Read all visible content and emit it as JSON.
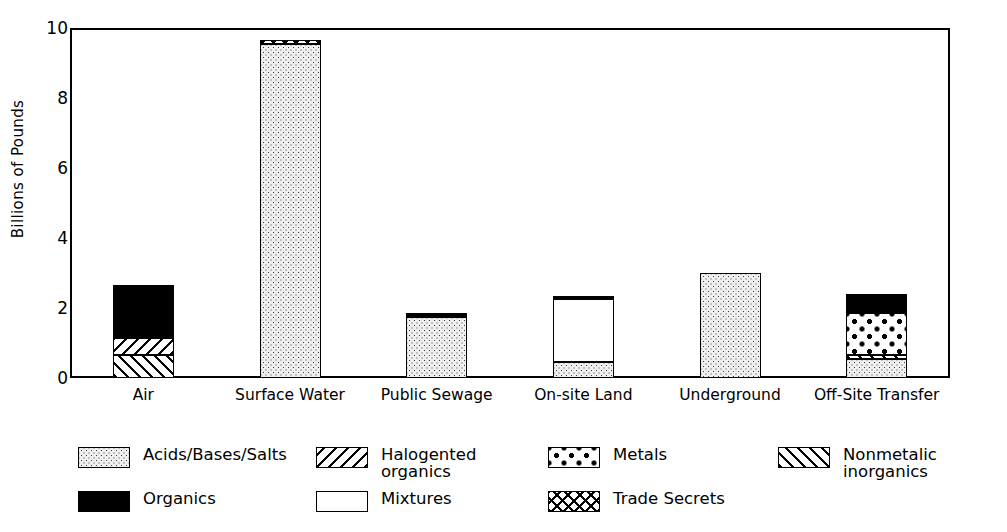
{
  "chart_data": {
    "type": "bar",
    "title": "",
    "xlabel": "",
    "ylabel": "Billions of Pounds",
    "ylim": [
      0,
      10
    ],
    "yticks": [
      0,
      2,
      4,
      6,
      8,
      10
    ],
    "grid": false,
    "stacked": true,
    "legend_position": "bottom",
    "categories": [
      "Air",
      "Surface Water",
      "Public Sewage",
      "On-site Land",
      "Underground",
      "Off-Site Transfer"
    ],
    "series": [
      {
        "name": "Acids/Bases/Salts",
        "key": "acids",
        "pattern": "fine-dots",
        "values": [
          0,
          9.55,
          1.75,
          0.47,
          3.0,
          0.55
        ]
      },
      {
        "name": "Organics",
        "key": "organics",
        "pattern": "solid-black",
        "values": [
          1.5,
          0,
          0.1,
          0.1,
          0,
          0.55
        ]
      },
      {
        "name": "Halogented organics",
        "key": "halo",
        "pattern": "backslash-hatch",
        "values": [
          0.5,
          0,
          0,
          0,
          0,
          0
        ]
      },
      {
        "name": "Mixtures",
        "key": "mixtures",
        "pattern": "white",
        "values": [
          0,
          0,
          0,
          1.78,
          0,
          0
        ]
      },
      {
        "name": "Metals",
        "key": "metals",
        "pattern": "coarse-dots",
        "values": [
          0,
          0,
          0,
          0,
          0,
          1.2
        ]
      },
      {
        "name": "Trade Secrets",
        "key": "trade",
        "pattern": "cross-hatch",
        "values": [
          0,
          0.1,
          0,
          0,
          0,
          0
        ]
      },
      {
        "name": "Nonmetalic inorganics",
        "key": "nonmetal",
        "pattern": "forward-hatch",
        "values": [
          0.65,
          0,
          0,
          0,
          0,
          0.1
        ]
      }
    ],
    "totals": [
      2.65,
      9.65,
      1.85,
      2.35,
      3.0,
      2.4
    ]
  },
  "yaxis": {
    "label": "Billions of Pounds",
    "ticks": [
      "0",
      "2",
      "4",
      "6",
      "8",
      "10"
    ]
  },
  "xaxis": {
    "labels": [
      "Air",
      "Surface Water",
      "Public Sewage",
      "On-site Land",
      "Underground",
      "Off-Site Transfer"
    ]
  },
  "legend": {
    "items": [
      {
        "label": "Acids/Bases/Salts",
        "pattern": "fine-dots"
      },
      {
        "label": "Organics",
        "pattern": "solid-black"
      },
      {
        "label": "Halogented\norganics",
        "pattern": "backslash-hatch"
      },
      {
        "label": "Mixtures",
        "pattern": "white"
      },
      {
        "label": "Metals",
        "pattern": "coarse-dots"
      },
      {
        "label": "Trade Secrets",
        "pattern": "cross-hatch"
      },
      {
        "label": "Nonmetalic inorganics",
        "pattern": "forward-hatch"
      }
    ]
  },
  "colors": {
    "ink": "#000000",
    "paper": "#ffffff",
    "fill_light": "#efefef"
  }
}
